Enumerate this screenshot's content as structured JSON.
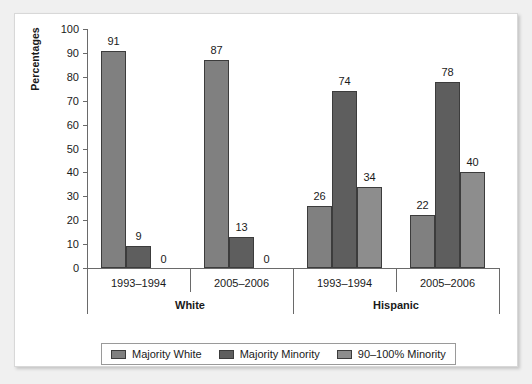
{
  "chart_data": {
    "type": "bar",
    "title": "",
    "subtitle": "",
    "xlabel": "",
    "ylabel": "Percentages",
    "ylim": [
      0,
      100
    ],
    "ytick_step": 10,
    "yticks": [
      "100",
      "90",
      "80",
      "70",
      "60",
      "50",
      "40",
      "30",
      "20",
      "10",
      "0"
    ],
    "grid": false,
    "legend_position": "bottom",
    "groups": [
      {
        "name": "White",
        "periods": [
          {
            "label": "1993–1994",
            "values": [
              91,
              9,
              0
            ]
          },
          {
            "label": "2005–2006",
            "values": [
              87,
              13,
              0
            ]
          }
        ]
      },
      {
        "name": "Hispanic",
        "periods": [
          {
            "label": "1993–1994",
            "values": [
              26,
              74,
              34
            ]
          },
          {
            "label": "2005–2006",
            "values": [
              22,
              78,
              40
            ]
          }
        ]
      }
    ],
    "series": [
      {
        "name": "Majority White",
        "color": "#808080",
        "values": [
          91,
          87,
          26,
          22
        ]
      },
      {
        "name": "Majority Minority",
        "color": "#5e5e5e",
        "values": [
          9,
          13,
          74,
          78
        ]
      },
      {
        "name": "90–100% Minority",
        "color": "#8d8d8d",
        "values": [
          0,
          0,
          34,
          40
        ]
      }
    ],
    "categories": [
      "White 1993–1994",
      "White 2005–2006",
      "Hispanic 1993–1994",
      "Hispanic 2005–2006"
    ],
    "legend": [
      {
        "label": "Majority White",
        "color": "#808080"
      },
      {
        "label": "Majority Minority",
        "color": "#5e5e5e"
      },
      {
        "label": "90–100% Minority",
        "color": "#8d8d8d"
      }
    ],
    "bar_labels": [
      "91",
      "9",
      "0",
      "87",
      "13",
      "0",
      "26",
      "74",
      "34",
      "22",
      "78",
      "40"
    ]
  },
  "axis": {
    "y_title": "Percentages",
    "ticks": [
      "100",
      "90",
      "80",
      "70",
      "60",
      "50",
      "40",
      "30",
      "20",
      "10",
      "0"
    ]
  },
  "groups": {
    "white": {
      "name": "White",
      "period1": {
        "label": "1993–1994",
        "v1": "91",
        "v2": "9",
        "v3": "0"
      },
      "period2": {
        "label": "2005–2006",
        "v1": "87",
        "v2": "13",
        "v3": "0"
      }
    },
    "hispanic": {
      "name": "Hispanic",
      "period1": {
        "label": "1993–1994",
        "v1": "26",
        "v2": "74",
        "v3": "34"
      },
      "period2": {
        "label": "2005–2006",
        "v1": "22",
        "v2": "78",
        "v3": "40"
      }
    }
  },
  "legend": {
    "items": [
      {
        "label": "Majority White"
      },
      {
        "label": "Majority Minority"
      },
      {
        "label": "90–100% Minority"
      }
    ]
  },
  "colors": {
    "series1": "#808080",
    "series2": "#5e5e5e",
    "series3": "#8d8d8d",
    "axis": "#6a6a6a",
    "text": "#1a1a1a",
    "panel_bg": "#ffffff",
    "page_bg": "#f0f0f0"
  }
}
